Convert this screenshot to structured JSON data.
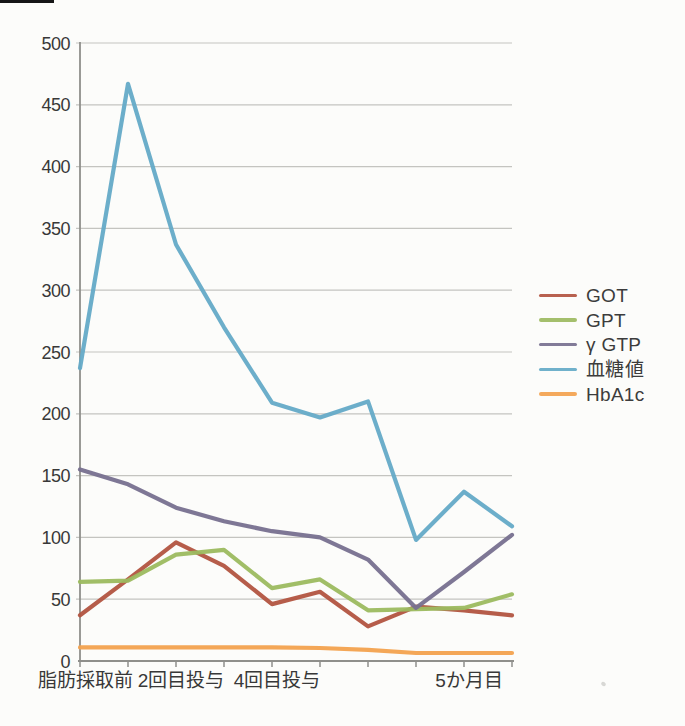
{
  "chart_data": {
    "type": "line",
    "title": "",
    "xlabel": "",
    "ylabel": "",
    "ylim": [
      0,
      500
    ],
    "y_ticks": [
      0,
      50,
      100,
      150,
      200,
      250,
      300,
      350,
      400,
      450,
      500
    ],
    "grid": true,
    "legend_position": "right",
    "categories": [
      "脂肪採取前",
      "",
      "2回目投与",
      "",
      "4回目投与",
      "",
      "",
      "",
      "5か月目",
      ""
    ],
    "series": [
      {
        "name": "GOT",
        "color": "#b25440",
        "values": [
          37,
          66,
          96,
          77,
          46,
          56,
          28,
          44,
          41,
          37
        ]
      },
      {
        "name": "GPT",
        "color": "#9cba5f",
        "values": [
          64,
          65,
          86,
          90,
          59,
          66,
          41,
          42,
          43,
          54
        ]
      },
      {
        "name": "γ GTP",
        "color": "#77708f",
        "values": [
          155,
          143,
          124,
          113,
          105,
          100,
          82,
          43,
          72,
          102
        ]
      },
      {
        "name": "血糖値",
        "color": "#64aac7",
        "values": [
          237,
          467,
          337,
          270,
          209,
          197,
          210,
          98,
          137,
          109
        ]
      },
      {
        "name": "HbA1c",
        "color": "#f3a24e",
        "values": [
          11,
          11,
          11,
          11,
          11,
          10.5,
          9,
          6.5,
          6.5,
          6.5
        ]
      }
    ]
  },
  "colors": {
    "background": "#fcfcfa",
    "gridline": "#c4c4c0",
    "axis": "#8f8f8b",
    "tick_text": "#383838",
    "legend_text": "#3c3c3c"
  }
}
